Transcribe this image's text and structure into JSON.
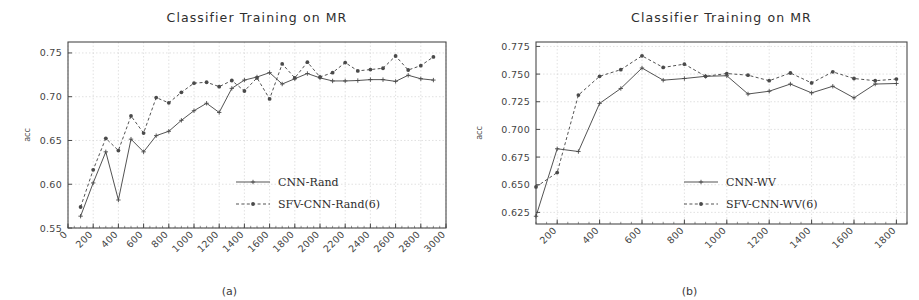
{
  "figure": {
    "subcaption_a": "(a)",
    "subcaption_b": "(b)",
    "ink_color": "#4a4a4a",
    "grid_color": "#cccccc",
    "background": "#ffffff"
  },
  "chart_data": [
    {
      "panel": "a",
      "type": "line",
      "title": "Classifier Training on MR",
      "xlabel": "",
      "ylabel": "acc",
      "xlim": [
        0,
        3000
      ],
      "ylim": [
        0.55,
        0.7625
      ],
      "xticks": [
        0,
        200,
        400,
        600,
        800,
        1000,
        1200,
        1400,
        1600,
        1800,
        2000,
        2200,
        2400,
        2600,
        2800,
        3000
      ],
      "xticklabels": [
        "0",
        "200",
        "400",
        "600",
        "800",
        "1000",
        "1200",
        "1400",
        "1600",
        "1800",
        "2000",
        "2200",
        "2400",
        "2600",
        "2800",
        "3000"
      ],
      "yticks": [
        0.55,
        0.6,
        0.65,
        0.7,
        0.75
      ],
      "yticklabels": [
        "0.55",
        "0.60",
        "0.65",
        "0.70",
        "0.75"
      ],
      "grid": true,
      "legend_position": "center-right",
      "x": [
        100,
        200,
        300,
        400,
        500,
        600,
        700,
        800,
        900,
        1000,
        1100,
        1200,
        1300,
        1400,
        1500,
        1600,
        1700,
        1800,
        1900,
        2000,
        2100,
        2200,
        2300,
        2400,
        2500,
        2600,
        2700,
        2800,
        2900
      ],
      "series": [
        {
          "name": "CNN-Rand",
          "style": "solid",
          "marker": "plus",
          "values": [
            0.5635,
            0.6015,
            0.637,
            0.582,
            0.6515,
            0.637,
            0.6555,
            0.6605,
            0.673,
            0.684,
            0.6925,
            0.682,
            0.7095,
            0.719,
            0.7225,
            0.7275,
            0.7145,
            0.7205,
            0.7265,
            0.7215,
            0.718,
            0.718,
            0.7185,
            0.7195,
            0.7195,
            0.7175,
            0.7245,
            0.7205,
            0.719
          ]
        },
        {
          "name": "SFV-CNN-Rand(6)",
          "style": "dashed",
          "marker": "dot",
          "values": [
            0.574,
            0.6165,
            0.6525,
            0.6385,
            0.678,
            0.6585,
            0.699,
            0.693,
            0.705,
            0.7155,
            0.7165,
            0.7115,
            0.7185,
            0.7065,
            0.7215,
            0.6975,
            0.7375,
            0.7215,
            0.7395,
            0.7225,
            0.7275,
            0.739,
            0.7295,
            0.731,
            0.7325,
            0.7465,
            0.7305,
            0.7355,
            0.7455
          ]
        }
      ]
    },
    {
      "panel": "b",
      "type": "line",
      "title": "Classifier Training on MR",
      "xlabel": "",
      "ylabel": "acc",
      "xlim": [
        100,
        1850
      ],
      "ylim": [
        0.6145,
        0.779
      ],
      "xticks": [
        200,
        400,
        600,
        800,
        1000,
        1200,
        1400,
        1600,
        1800
      ],
      "xticklabels": [
        "200",
        "400",
        "600",
        "800",
        "1000",
        "1200",
        "1400",
        "1600",
        "1800"
      ],
      "yticks": [
        0.625,
        0.65,
        0.675,
        0.7,
        0.725,
        0.75,
        0.775
      ],
      "yticklabels": [
        "0.625",
        "0.650",
        "0.675",
        "0.700",
        "0.725",
        "0.750",
        "0.775"
      ],
      "grid": true,
      "legend_position": "center-right",
      "x": [
        100,
        200,
        300,
        400,
        500,
        600,
        700,
        800,
        900,
        1000,
        1100,
        1200,
        1300,
        1400,
        1500,
        1600,
        1700,
        1800
      ],
      "series": [
        {
          "name": "CNN-WV",
          "style": "solid",
          "marker": "plus",
          "values": [
            0.6215,
            0.6825,
            0.68,
            0.7235,
            0.737,
            0.7555,
            0.7445,
            0.746,
            0.748,
            0.7485,
            0.732,
            0.7345,
            0.741,
            0.733,
            0.739,
            0.7285,
            0.741,
            0.7415
          ]
        },
        {
          "name": "SFV-CNN-WV(6)",
          "style": "dashed",
          "marker": "dot",
          "values": [
            0.648,
            0.661,
            0.731,
            0.748,
            0.754,
            0.7665,
            0.756,
            0.759,
            0.748,
            0.7505,
            0.749,
            0.744,
            0.751,
            0.742,
            0.752,
            0.746,
            0.744,
            0.7455
          ]
        }
      ]
    }
  ]
}
